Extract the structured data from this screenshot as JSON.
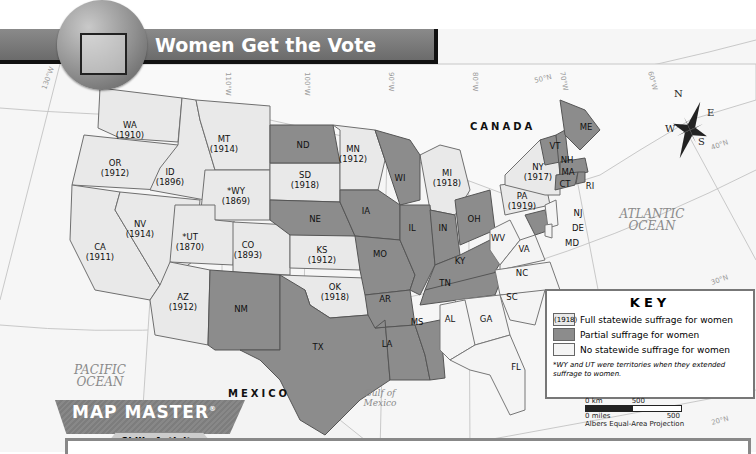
{
  "title": "Women Get the Vote",
  "colors": {
    "full_suffrage": "#e9e9e9",
    "partial_suffrage": "#8c8c8c",
    "no_suffrage": "#f4f4f4",
    "title_bar": "#777777",
    "background": "#f7f7f7"
  },
  "labels": {
    "canada": "CANADA",
    "mexico": "MEXICO",
    "pacific_1": "PACIFIC",
    "pacific_2": "OCEAN",
    "atlantic_1": "ATLANTIC",
    "atlantic_2": "OCEAN",
    "gulf_1": "Gulf of",
    "gulf_2": "Mexico"
  },
  "grid_labels": [
    "130°W",
    "110°W",
    "100°W",
    "90°W",
    "80°W",
    "70°W",
    "60°W",
    "50°N",
    "40°N",
    "30°N",
    "20°N"
  ],
  "compass": {
    "n": "N",
    "e": "E",
    "s": "S",
    "w": "W"
  },
  "states": [
    {
      "abbr": "WA",
      "year": "(1910)",
      "category": "full"
    },
    {
      "abbr": "OR",
      "year": "(1912)",
      "category": "full"
    },
    {
      "abbr": "CA",
      "year": "(1911)",
      "category": "full"
    },
    {
      "abbr": "ID",
      "year": "(1896)",
      "category": "full"
    },
    {
      "abbr": "NV",
      "year": "(1914)",
      "category": "full"
    },
    {
      "abbr": "MT",
      "year": "(1914)",
      "category": "full"
    },
    {
      "abbr": "*WY",
      "year": "(1869)",
      "category": "full"
    },
    {
      "abbr": "*UT",
      "year": "(1870)",
      "category": "full"
    },
    {
      "abbr": "CO",
      "year": "(1893)",
      "category": "full"
    },
    {
      "abbr": "AZ",
      "year": "(1912)",
      "category": "full"
    },
    {
      "abbr": "NM",
      "year": "",
      "category": "partial"
    },
    {
      "abbr": "ND",
      "year": "",
      "category": "partial"
    },
    {
      "abbr": "SD",
      "year": "(1918)",
      "category": "full"
    },
    {
      "abbr": "NE",
      "year": "",
      "category": "partial"
    },
    {
      "abbr": "KS",
      "year": "(1912)",
      "category": "full"
    },
    {
      "abbr": "OK",
      "year": "(1918)",
      "category": "full"
    },
    {
      "abbr": "TX",
      "year": "",
      "category": "partial"
    },
    {
      "abbr": "MN",
      "year": "(1912)",
      "category": "full"
    },
    {
      "abbr": "IA",
      "year": "",
      "category": "partial"
    },
    {
      "abbr": "MO",
      "year": "",
      "category": "partial"
    },
    {
      "abbr": "AR",
      "year": "",
      "category": "partial"
    },
    {
      "abbr": "LA",
      "year": "",
      "category": "partial"
    },
    {
      "abbr": "WI",
      "year": "",
      "category": "partial"
    },
    {
      "abbr": "IL",
      "year": "",
      "category": "partial"
    },
    {
      "abbr": "MS",
      "year": "",
      "category": "partial"
    },
    {
      "abbr": "MI",
      "year": "(1918)",
      "category": "full"
    },
    {
      "abbr": "IN",
      "year": "",
      "category": "partial"
    },
    {
      "abbr": "KY",
      "year": "",
      "category": "partial"
    },
    {
      "abbr": "TN",
      "year": "",
      "category": "partial"
    },
    {
      "abbr": "AL",
      "year": "",
      "category": "none"
    },
    {
      "abbr": "OH",
      "year": "",
      "category": "partial"
    },
    {
      "abbr": "GA",
      "year": "",
      "category": "none"
    },
    {
      "abbr": "FL",
      "year": "",
      "category": "none"
    },
    {
      "abbr": "SC",
      "year": "",
      "category": "none"
    },
    {
      "abbr": "NC",
      "year": "",
      "category": "none"
    },
    {
      "abbr": "VA",
      "year": "",
      "category": "none"
    },
    {
      "abbr": "WV",
      "year": "",
      "category": "none"
    },
    {
      "abbr": "PA",
      "year": "(1919)",
      "category": "full"
    },
    {
      "abbr": "NY",
      "year": "(1917)",
      "category": "full"
    },
    {
      "abbr": "NJ",
      "year": "",
      "category": "none"
    },
    {
      "abbr": "DE",
      "year": "",
      "category": "none"
    },
    {
      "abbr": "MD",
      "year": "",
      "category": "partial"
    },
    {
      "abbr": "VT",
      "year": "",
      "category": "partial"
    },
    {
      "abbr": "NH",
      "year": "",
      "category": "partial"
    },
    {
      "abbr": "MA",
      "year": "",
      "category": "partial"
    },
    {
      "abbr": "CT",
      "year": "",
      "category": "partial"
    },
    {
      "abbr": "RI",
      "year": "",
      "category": "partial"
    },
    {
      "abbr": "ME",
      "year": "",
      "category": "partial"
    }
  ],
  "key": {
    "title": "KEY",
    "items": [
      {
        "swatch_text": "(1918)",
        "label": "Full statewide suffrage for women"
      },
      {
        "swatch_text": "",
        "label": "Partial suffrage for women"
      },
      {
        "swatch_text": "",
        "label": "No statewide suffrage for women"
      }
    ],
    "note": "*WY and UT were territories when they extended suffrage to women."
  },
  "scale": {
    "km_label": "0 km",
    "km_value": "500",
    "mi_label": "0 miles",
    "mi_value": "500",
    "projection": "Albers Equal-Area Projection"
  },
  "map_master": {
    "brand": "MAP MASTER",
    "registered": "®",
    "subtitle": "Skills Activity"
  }
}
